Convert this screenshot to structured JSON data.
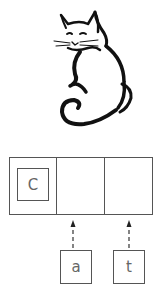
{
  "figure": {
    "image": "cat-line-drawing",
    "cells": [
      {
        "index": 0,
        "content": "C"
      },
      {
        "index": 1,
        "content": ""
      },
      {
        "index": 2,
        "content": ""
      }
    ],
    "incoming_letters": [
      {
        "label": "a",
        "target_cell": 1
      },
      {
        "label": "t",
        "target_cell": 2
      }
    ],
    "colors": {
      "stroke": "#555555",
      "ink": "#111111"
    }
  }
}
